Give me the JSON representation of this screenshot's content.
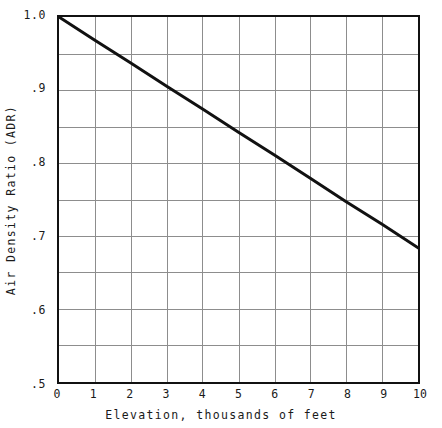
{
  "chart_data": {
    "type": "line",
    "title": "",
    "subtitle": "",
    "xlabel": "Elevation, thousands of feet",
    "ylabel": "Air Density Ratio (ADR)",
    "xlim": [
      0,
      10
    ],
    "ylim": [
      0.5,
      1.0
    ],
    "grid": true,
    "legend": null,
    "legend_position": "none",
    "x_tick_labels": [
      "0",
      "1",
      "2",
      "3",
      "4",
      "5",
      "6",
      "7",
      "8",
      "9",
      "10"
    ],
    "x_tick_values": [
      0,
      1,
      2,
      3,
      4,
      5,
      6,
      7,
      8,
      9,
      10
    ],
    "y_tick_labels": [
      "1.0",
      ".9",
      ".8",
      ".7",
      ".6",
      ".5"
    ],
    "y_tick_values": [
      1.0,
      0.9,
      0.8,
      0.7,
      0.6,
      0.5
    ],
    "x_minor_gridline_step": 1,
    "y_minor_gridline_step": 0.05,
    "series": [
      {
        "name": "Air Density Ratio",
        "color": "#111111",
        "line_width": 3,
        "x": [
          0,
          1,
          2,
          3,
          4,
          5,
          6,
          7,
          8,
          9,
          10
        ],
        "values": [
          1.0,
          0.968,
          0.937,
          0.905,
          0.874,
          0.842,
          0.811,
          0.779,
          0.747,
          0.716,
          0.684
        ]
      }
    ],
    "annotations": []
  },
  "figure": {
    "background_color": "#ffffff",
    "frame_color": "#111111",
    "grid_color": "#8d8d8d"
  }
}
